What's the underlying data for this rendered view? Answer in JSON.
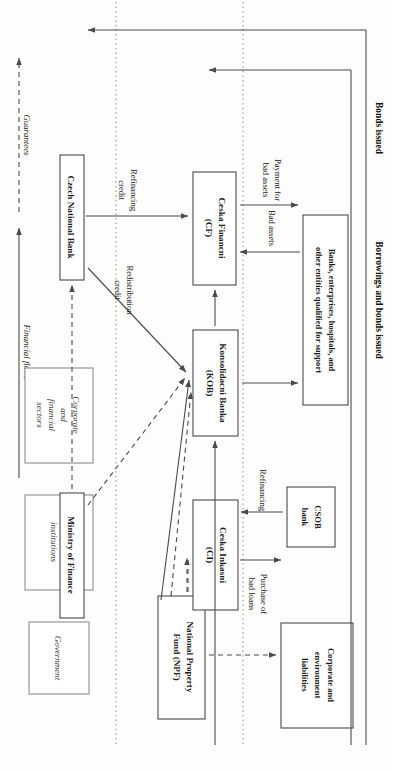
{
  "figure": {
    "orientation": "rotated-90-clockwise"
  },
  "legend": {
    "financial_flows": "Financial flows",
    "guarantees": "Guarantees"
  },
  "side_labels": {
    "bonds_issued": "Bonds issued",
    "borrowings_and_bonds_issued": "Borrowings and bonds issued"
  },
  "zones": [
    {
      "id": "government",
      "label": "Government"
    },
    {
      "id": "special-institutions",
      "label": "Special\ninstitutions"
    },
    {
      "id": "corporate-financial-sectors",
      "label": "Corporate\nand\nfinancial\nsectors"
    }
  ],
  "nodes": [
    {
      "id": "cnb",
      "line1": "Czech National Bank",
      "line2": ""
    },
    {
      "id": "mof",
      "line1": "Ministry of Finance",
      "line2": ""
    },
    {
      "id": "npf",
      "line1": "National Property",
      "line2": "Fund (NPF)"
    },
    {
      "id": "ci",
      "line1": "Ceska Inkasni",
      "line2": "(CI)"
    },
    {
      "id": "kob",
      "line1": "Konsolidacni Banka",
      "line2": "(KOB)"
    },
    {
      "id": "cf",
      "line1": "Ceska Financni",
      "line2": "(CF)"
    },
    {
      "id": "corp",
      "line1": "Corporate and",
      "line2": "environment",
      "line3": "liabilities"
    },
    {
      "id": "csob",
      "line1": "CSOB",
      "line2": "bank"
    },
    {
      "id": "banks",
      "line1": "Banks, enterprises, hospitals, and",
      "line2": "other entities qualified for support"
    }
  ],
  "edge_labels": {
    "purchase_of_bad_loans_1": "Purchase of",
    "purchase_of_bad_loans_2": "bad loans",
    "refinancing": "Refinancing",
    "redistribution_credit_1": "Redistribution",
    "redistribution_credit_2": "credit",
    "refinancing_credit_1": "Refinancing",
    "refinancing_credit_2": "credit",
    "bad_assets": "Bad assets",
    "payment_for_bad_assets_1": "Payment for",
    "payment_for_bad_assets_2": "bad assets"
  },
  "colors": {
    "box_stroke": "#4a4a4a",
    "line": "#4a4a4a",
    "divider": "#777777",
    "background": "#fdfdfb",
    "text": "#1a1a1a"
  }
}
